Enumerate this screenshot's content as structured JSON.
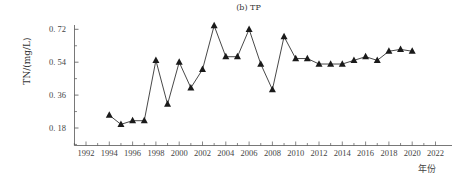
{
  "chart_data": {
    "type": "line",
    "title": "(b) TP",
    "xlabel": "年份",
    "ylabel": "TN/(mg/L)",
    "x": [
      1994,
      1995,
      1996,
      1997,
      1998,
      1999,
      2000,
      2001,
      2002,
      2003,
      2004,
      2005,
      2006,
      2007,
      2008,
      2009,
      2010,
      2011,
      2012,
      2013,
      2014,
      2015,
      2016,
      2017,
      2018,
      2019,
      2020
    ],
    "series": [
      {
        "name": "TP",
        "marker": "triangle",
        "color": "#1a1a1a",
        "values": [
          0.25,
          0.2,
          0.22,
          0.22,
          0.55,
          0.31,
          0.54,
          0.4,
          0.5,
          0.74,
          0.57,
          0.57,
          0.72,
          0.53,
          0.39,
          0.68,
          0.56,
          0.56,
          0.53,
          0.53,
          0.53,
          0.55,
          0.57,
          0.55,
          0.6,
          0.61,
          0.6
        ]
      }
    ],
    "xlim": [
      1991,
      2023
    ],
    "ylim": [
      0.08,
      0.74
    ],
    "xticks": [
      "1992",
      "1994",
      "1996",
      "1998",
      "2000",
      "2002",
      "2004",
      "2006",
      "2008",
      "2010",
      "2012",
      "2014",
      "2016",
      "2018",
      "2020",
      "2022"
    ],
    "yticks": [
      "0. 18",
      "0. 36",
      "0. 54",
      "0. 72"
    ],
    "ytick_values": [
      0.18,
      0.36,
      0.54,
      0.72
    ],
    "grid": false,
    "legend": "none"
  }
}
